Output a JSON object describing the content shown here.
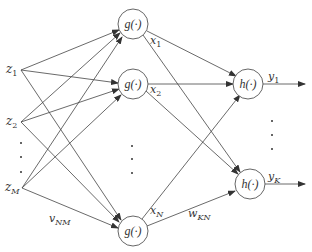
{
  "diagram": {
    "type": "two-layer neural network",
    "inputs": [
      {
        "id": "z1",
        "label": "z",
        "sub": "1"
      },
      {
        "id": "z2",
        "label": "z",
        "sub": "2"
      },
      {
        "id": "zM",
        "label": "z",
        "sub": "M"
      }
    ],
    "hidden_nodes": [
      {
        "id": "g1",
        "label": "g(·)",
        "output_label": "x",
        "output_sub": "1"
      },
      {
        "id": "g2",
        "label": "g(·)",
        "output_label": "x",
        "output_sub": "2"
      },
      {
        "id": "gN",
        "label": "g(·)",
        "output_label": "x",
        "output_sub": "N"
      }
    ],
    "output_nodes": [
      {
        "id": "h1",
        "label": "h(·)",
        "output_label": "y",
        "output_sub": "1"
      },
      {
        "id": "hK",
        "label": "h(·)",
        "output_label": "y",
        "output_sub": "K"
      }
    ],
    "weights": {
      "input_hidden": {
        "label": "v",
        "sub": "NM"
      },
      "hidden_output": {
        "label": "w",
        "sub": "KN"
      }
    },
    "ellipsis": "⋮"
  }
}
